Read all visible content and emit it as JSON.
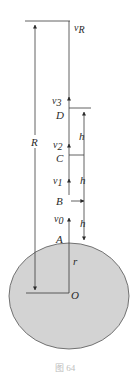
{
  "diagram": {
    "type": "physics-figure",
    "caption": "图 64",
    "labels": {
      "vR": {
        "base": "v",
        "sub": "R"
      },
      "v3": {
        "base": "v",
        "sub": "3"
      },
      "v2": {
        "base": "v",
        "sub": "2"
      },
      "v1": {
        "base": "v",
        "sub": "1"
      },
      "v0": {
        "base": "v",
        "sub": "0"
      },
      "R": "R",
      "r": "r",
      "O": "O",
      "A": "A",
      "B": "B",
      "C": "C",
      "D": "D",
      "h1": "h",
      "h2": "h",
      "h3": "h"
    },
    "colors": {
      "line": "#3a3a3a",
      "planet_fill": "#d3d3d3",
      "planet_stroke": "#555555",
      "caption": "#bdbdbd"
    },
    "planet": {
      "cx": 69,
      "cy": 296,
      "rx": 60,
      "ry": 53
    }
  }
}
